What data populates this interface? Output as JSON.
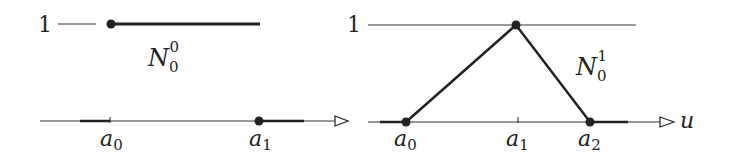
{
  "figure": {
    "colors": {
      "stroke": "#222222",
      "background": "#ffffff"
    },
    "left_panel": {
      "name": "degree-0 basis function",
      "y_label": "1",
      "function_label": {
        "base": "N",
        "sub": "0",
        "sup": "0"
      },
      "axis_labels": [
        {
          "base": "a",
          "sub": "0"
        },
        {
          "base": "a",
          "sub": "1"
        }
      ]
    },
    "right_panel": {
      "name": "degree-1 basis function",
      "y_label": "1",
      "function_label": {
        "base": "N",
        "sub": "0",
        "sup": "1"
      },
      "axis_labels": [
        {
          "base": "a",
          "sub": "0"
        },
        {
          "base": "a",
          "sub": "1"
        },
        {
          "base": "a",
          "sub": "2"
        }
      ],
      "axis_variable": "u"
    }
  }
}
